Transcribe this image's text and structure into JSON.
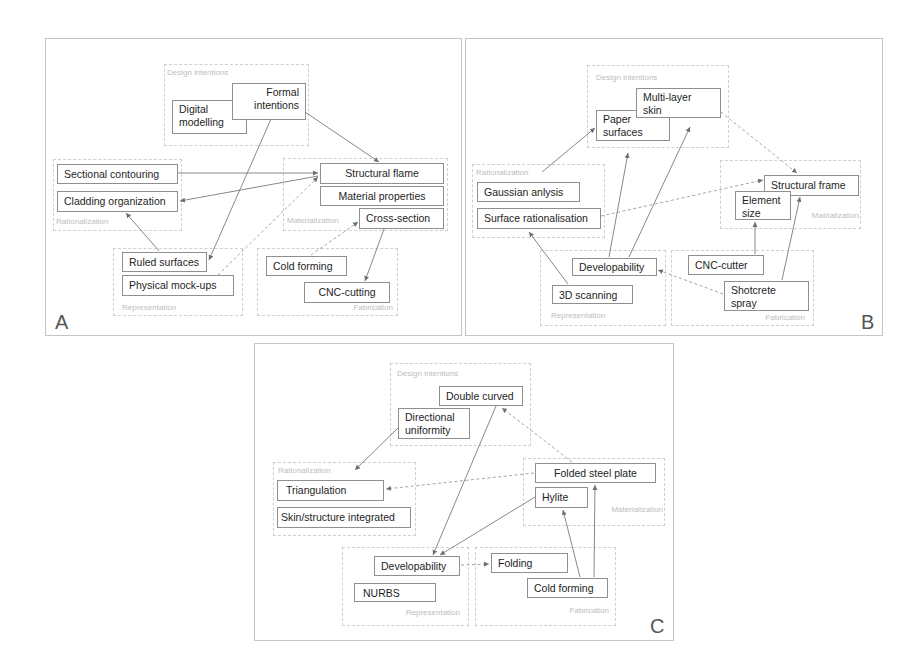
{
  "panels": [
    {
      "id": "A",
      "letter": "A",
      "groups": {
        "design": "Design intentions",
        "rationalization": "Rationalization",
        "materialization": "Materialization",
        "representation": "Representation",
        "fabrication": "Fabrication"
      },
      "nodes": {
        "digital_modelling": "Digital modelling",
        "formal_intentions": "Formal intentions",
        "sectional_contouring": "Sectional contouring",
        "cladding_organization": "Cladding organization",
        "structural_flame": "Structural flame",
        "material_properties": "Material properties",
        "cross_section": "Cross-section",
        "ruled_surfaces": "Ruled surfaces",
        "physical_mockups": "Physical mock-ups",
        "cold_forming": "Cold forming",
        "cnc_cutting": "CNC-cutting"
      },
      "edges": [
        {
          "from": "Formal intentions",
          "to": "Structural flame",
          "style": "solid"
        },
        {
          "from": "Formal intentions",
          "to": "Ruled surfaces",
          "style": "solid"
        },
        {
          "from": "Sectional contouring",
          "to": "Structural flame",
          "style": "solid"
        },
        {
          "from": "Structural flame",
          "to": "Cladding organization",
          "style": "solid"
        },
        {
          "from": "Ruled surfaces",
          "to": "Cladding organization",
          "style": "solid"
        },
        {
          "from": "Physical mock-ups",
          "to": "Structural flame",
          "style": "dashed"
        },
        {
          "from": "Cold forming",
          "to": "Cross-section",
          "style": "dashed"
        },
        {
          "from": "Cross-section",
          "to": "CNC-cutting",
          "style": "solid"
        }
      ]
    },
    {
      "id": "B",
      "letter": "B",
      "groups": {
        "design": "Design intentions",
        "rationalization": "Rationalization",
        "materialization": "Matrialization",
        "representation": "Representation",
        "fabrication": "Fabrication"
      },
      "nodes": {
        "paper_surfaces": "Paper surfaces",
        "multi_layer_skin": "Multi-layer skin",
        "gaussian_analysis": "Gaussian anlysis",
        "surface_rationalisation": "Surface rationalisation",
        "structural_frame": "Structural frame",
        "element_size": "Element size",
        "developability": "Developability",
        "scanning_3d": "3D scanning",
        "cnc_cutter": "CNC-cutter",
        "shotcrete_spray": "Shotcrete spray"
      },
      "edges": [
        {
          "from": "Rationalization",
          "to": "Paper surfaces",
          "style": "solid"
        },
        {
          "from": "Multi-layer skin",
          "to": "Structural frame",
          "style": "dashed"
        },
        {
          "from": "Surface rationalisation",
          "to": "Structural frame",
          "style": "dashed"
        },
        {
          "from": "Developability",
          "to": "Paper surfaces",
          "style": "solid"
        },
        {
          "from": "Developability",
          "to": "Multi-layer skin",
          "style": "solid"
        },
        {
          "from": "3D scanning",
          "to": "Surface rationalisation",
          "style": "solid"
        },
        {
          "from": "Shotcrete spray",
          "to": "Developability",
          "style": "dashed"
        },
        {
          "from": "CNC-cutter",
          "to": "Element size",
          "style": "solid"
        },
        {
          "from": "Shotcrete spray",
          "to": "Structural frame",
          "style": "solid"
        }
      ]
    },
    {
      "id": "C",
      "letter": "C",
      "groups": {
        "design": "Design intentions",
        "rationalization": "Rationalization",
        "materialization": "Materialization",
        "representation": "Representation",
        "fabrication": "Fabrication"
      },
      "nodes": {
        "double_curved": "Double curved",
        "directional_uniformity": "Directional uniformity",
        "triangulation": "Triangulation",
        "skin_structure_integrated": "Skin/structure integrated",
        "folded_steel_plate": "Folded steel plate",
        "hylite": "Hylite",
        "developability": "Developability",
        "nurbs": "NURBS",
        "folding": "Folding",
        "cold_forming": "Cold forming"
      },
      "edges": [
        {
          "from": "Directional uniformity",
          "to": "Triangulation",
          "style": "solid"
        },
        {
          "from": "Double curved",
          "to": "Developability",
          "style": "solid"
        },
        {
          "from": "Folded steel plate",
          "to": "Double curved",
          "style": "dashed"
        },
        {
          "from": "Folded steel plate",
          "to": "Triangulation",
          "style": "dashed"
        },
        {
          "from": "Hylite",
          "to": "Developability",
          "style": "solid"
        },
        {
          "from": "Developability",
          "to": "Folding",
          "style": "dashed"
        },
        {
          "from": "Cold forming",
          "to": "Hylite",
          "style": "solid"
        },
        {
          "from": "Cold forming",
          "to": "Folded steel plate",
          "style": "solid"
        }
      ]
    }
  ],
  "colors": {
    "node_border": "#8f8f8f",
    "group_border": "#cfcfcf",
    "group_label": "#bdbdbd",
    "edge": "#7a7a7a",
    "text": "#1e1e1e"
  }
}
